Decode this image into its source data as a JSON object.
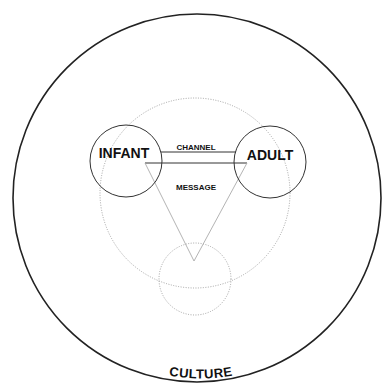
{
  "diagram": {
    "outer_label": "CULTURE",
    "nodes": {
      "infant": "INFANT",
      "adult": "ADULT"
    },
    "links": {
      "channel": "CHANNEL",
      "message": "MESSAGE"
    },
    "colors": {
      "stroke": "#222222",
      "dotted": "#9a9a9a",
      "text": "#111111",
      "background": "#ffffff"
    }
  }
}
